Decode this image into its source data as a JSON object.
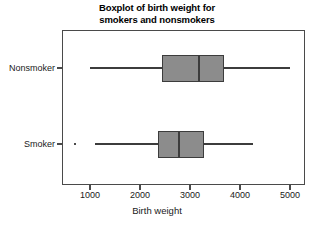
{
  "chart_data": {
    "type": "box",
    "title": "Boxplot of birth weight for smokers and nonsmokers",
    "title_line1": "Boxplot of birth weight for",
    "title_line2": "smokers and nonsmokers",
    "xlabel": "Birth weight",
    "ylabel": "",
    "orientation": "horizontal",
    "xlim": [
      500,
      5300
    ],
    "xticks": [
      1000,
      2000,
      3000,
      4000,
      5000
    ],
    "xticklabels": [
      "1000",
      "2000",
      "3000",
      "4000",
      "5000"
    ],
    "categories": [
      "Nonsmoker",
      "Smoker"
    ],
    "grid": false,
    "legend": false,
    "boxes": [
      {
        "label": "Nonsmoker",
        "whisker_low": 1000,
        "q1": 2440,
        "median": 3180,
        "q3": 3680,
        "whisker_high": 5000,
        "outliers": []
      },
      {
        "label": "Smoker",
        "whisker_low": 1100,
        "q1": 2360,
        "median": 2780,
        "q3": 3280,
        "whisker_high": 4250,
        "outliers": [
          700
        ]
      }
    ],
    "colors": {
      "box_fill": "#8c8c8c",
      "line": "#3c3c3c",
      "frame": "#4a4a4a",
      "text": "#1a1a1a",
      "background": "#ffffff"
    }
  }
}
